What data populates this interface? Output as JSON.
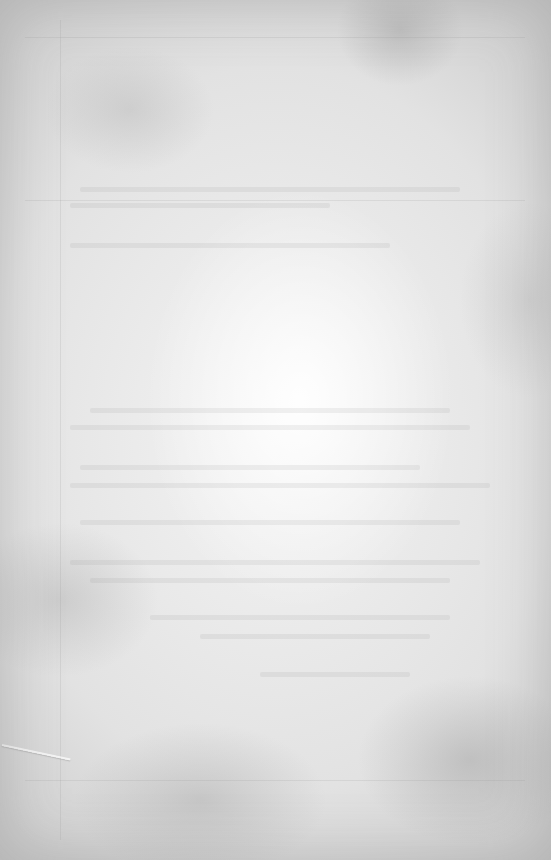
{
  "page": {
    "colors": {
      "center": "#f4f4f4",
      "mid": "#e2e2e2",
      "edge": "#cfcfcf"
    }
  }
}
